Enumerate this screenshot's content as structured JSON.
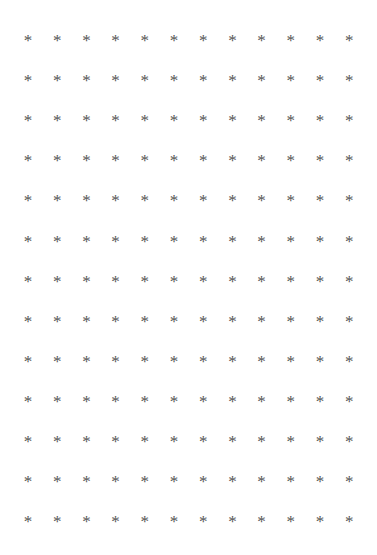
{
  "canvas": {
    "width": 377,
    "height": 555,
    "background_color": "#ffffff"
  },
  "grid": {
    "name": "asterisk-grid",
    "rows": 13,
    "columns": 12,
    "total_glyphs": 156,
    "glyph": "*",
    "glyph_icon_name": "asterisk-icon",
    "glyph_color": "#555555",
    "glyph_font_size_px": 17,
    "first_glyph_center": {
      "x": 28,
      "y": 41
    },
    "column_pitch_px": 29.2,
    "row_pitch_px": 40.1,
    "margins": {
      "left": 28,
      "right": 28,
      "top": 41,
      "bottom": 31
    }
  },
  "cells": [
    [
      "*",
      "*",
      "*",
      "*",
      "*",
      "*",
      "*",
      "*",
      "*",
      "*",
      "*",
      "*"
    ],
    [
      "*",
      "*",
      "*",
      "*",
      "*",
      "*",
      "*",
      "*",
      "*",
      "*",
      "*",
      "*"
    ],
    [
      "*",
      "*",
      "*",
      "*",
      "*",
      "*",
      "*",
      "*",
      "*",
      "*",
      "*",
      "*"
    ],
    [
      "*",
      "*",
      "*",
      "*",
      "*",
      "*",
      "*",
      "*",
      "*",
      "*",
      "*",
      "*"
    ],
    [
      "*",
      "*",
      "*",
      "*",
      "*",
      "*",
      "*",
      "*",
      "*",
      "*",
      "*",
      "*"
    ],
    [
      "*",
      "*",
      "*",
      "*",
      "*",
      "*",
      "*",
      "*",
      "*",
      "*",
      "*",
      "*"
    ],
    [
      "*",
      "*",
      "*",
      "*",
      "*",
      "*",
      "*",
      "*",
      "*",
      "*",
      "*",
      "*"
    ],
    [
      "*",
      "*",
      "*",
      "*",
      "*",
      "*",
      "*",
      "*",
      "*",
      "*",
      "*",
      "*"
    ],
    [
      "*",
      "*",
      "*",
      "*",
      "*",
      "*",
      "*",
      "*",
      "*",
      "*",
      "*",
      "*"
    ],
    [
      "*",
      "*",
      "*",
      "*",
      "*",
      "*",
      "*",
      "*",
      "*",
      "*",
      "*",
      "*"
    ],
    [
      "*",
      "*",
      "*",
      "*",
      "*",
      "*",
      "*",
      "*",
      "*",
      "*",
      "*",
      "*"
    ],
    [
      "*",
      "*",
      "*",
      "*",
      "*",
      "*",
      "*",
      "*",
      "*",
      "*",
      "*",
      "*"
    ],
    [
      "*",
      "*",
      "*",
      "*",
      "*",
      "*",
      "*",
      "*",
      "*",
      "*",
      "*",
      "*"
    ]
  ]
}
